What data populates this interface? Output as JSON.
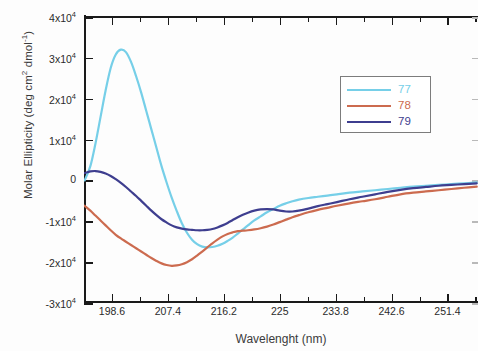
{
  "chart_data": {
    "type": "line",
    "title": "",
    "xlabel": "Wavelenght (nm)",
    "ylabel": "Molar Ellipticity (deg cm2 dmol-1)",
    "ylabel_parts": {
      "prefix": "Molar Ellipticity (deg cm",
      "sup1": "2",
      "middle": " dmol",
      "sup2": "-1",
      "suffix": ")"
    },
    "xlim": [
      194.2,
      256.2
    ],
    "ylim": [
      -30000,
      40000
    ],
    "grid": false,
    "legend_position": "upper-right-inside",
    "xticks": [
      198.6,
      207.4,
      216.2,
      225,
      233.8,
      242.6,
      251.4
    ],
    "xtick_labels": [
      "198.6",
      "207.4",
      "216.2",
      "225",
      "233.8",
      "242.6",
      "251.4"
    ],
    "yticks": [
      40000,
      30000,
      20000,
      10000,
      0,
      -10000,
      -20000,
      -30000
    ],
    "ytick_labels": [
      {
        "mantissa": "4x10",
        "exp": "4"
      },
      {
        "mantissa": "3x10",
        "exp": "4"
      },
      {
        "mantissa": "2x10",
        "exp": "4"
      },
      {
        "mantissa": "1x10",
        "exp": "4"
      },
      {
        "mantissa": "0",
        "exp": ""
      },
      {
        "mantissa": "-1x10",
        "exp": "4"
      },
      {
        "mantissa": "-2x10",
        "exp": "4"
      },
      {
        "mantissa": "-3x10",
        "exp": "4"
      }
    ],
    "series": [
      {
        "name": "77",
        "color": "#76CFE8",
        "x": [
          194.3,
          195.2,
          196.0,
          196.8,
          197.6,
          198.4,
          199.2,
          200.0,
          200.8,
          201.6,
          202.4,
          203.2,
          204.0,
          204.8,
          205.6,
          206.4,
          207.2,
          208.0,
          208.8,
          209.6,
          210.4,
          211.2,
          212.0,
          212.8,
          213.6,
          214.4,
          215.2,
          216.0,
          216.8,
          217.6,
          218.4,
          219.2,
          220.0,
          221.0,
          222.0,
          223.0,
          224.0,
          225.0,
          226.0,
          227.0,
          228.0,
          229.5,
          231.0,
          232.5,
          234.0,
          236.0,
          238.0,
          240.0,
          242.0,
          244.0,
          246.0,
          248.0,
          250.0,
          252.0,
          254.0,
          256.0
        ],
        "y": [
          0,
          3500,
          9000,
          15500,
          22000,
          27500,
          30800,
          32000,
          31400,
          29000,
          25500,
          21500,
          17000,
          12500,
          8000,
          3500,
          -500,
          -4200,
          -7500,
          -10500,
          -12800,
          -14500,
          -15600,
          -16200,
          -16400,
          -16300,
          -16000,
          -15500,
          -14800,
          -14000,
          -13000,
          -12000,
          -11000,
          -9800,
          -8800,
          -7800,
          -7000,
          -6200,
          -5600,
          -5100,
          -4700,
          -4300,
          -4000,
          -3700,
          -3400,
          -3000,
          -2700,
          -2400,
          -2100,
          -1800,
          -1500,
          -1300,
          -1100,
          -900,
          -700,
          -500
        ]
      },
      {
        "name": "78",
        "color": "#CC6B4F",
        "x": [
          194.3,
          195.2,
          196.0,
          196.8,
          197.6,
          198.4,
          199.2,
          200.0,
          200.8,
          201.6,
          202.4,
          203.2,
          204.0,
          204.8,
          205.6,
          206.4,
          207.2,
          208.0,
          208.8,
          209.6,
          210.4,
          211.2,
          212.0,
          212.8,
          213.6,
          214.4,
          215.2,
          216.0,
          216.8,
          217.6,
          218.4,
          219.2,
          220.0,
          221.0,
          222.0,
          223.0,
          224.0,
          225.0,
          226.0,
          227.0,
          228.0,
          229.5,
          231.0,
          232.5,
          234.0,
          236.0,
          238.0,
          240.0,
          242.0,
          244.0,
          246.0,
          248.0,
          250.0,
          252.0,
          254.0,
          256.0
        ],
        "y": [
          -6200,
          -7400,
          -8600,
          -9800,
          -11000,
          -12200,
          -13300,
          -14200,
          -15000,
          -15800,
          -16600,
          -17400,
          -18200,
          -19000,
          -19700,
          -20300,
          -20700,
          -20900,
          -20800,
          -20500,
          -20000,
          -19300,
          -18400,
          -17400,
          -16400,
          -15400,
          -14500,
          -13700,
          -13100,
          -12700,
          -12400,
          -12300,
          -12200,
          -12000,
          -11700,
          -11300,
          -10800,
          -10200,
          -9600,
          -9000,
          -8500,
          -7800,
          -7200,
          -6700,
          -6200,
          -5600,
          -5100,
          -4600,
          -4000,
          -3400,
          -3000,
          -2700,
          -2400,
          -2100,
          -1800,
          -1500
        ]
      },
      {
        "name": "79",
        "color": "#3E3E8F",
        "x": [
          194.3,
          195.2,
          196.0,
          196.8,
          197.6,
          198.4,
          199.2,
          200.0,
          200.8,
          201.6,
          202.4,
          203.2,
          204.0,
          204.8,
          205.6,
          206.4,
          207.2,
          208.0,
          208.8,
          209.6,
          210.4,
          211.2,
          212.0,
          212.8,
          213.6,
          214.4,
          215.2,
          216.0,
          216.8,
          217.6,
          218.4,
          219.2,
          220.0,
          221.0,
          222.0,
          223.0,
          224.0,
          225.0,
          226.0,
          227.0,
          228.0,
          229.5,
          231.0,
          232.5,
          234.0,
          236.0,
          238.0,
          240.0,
          242.0,
          244.0,
          246.0,
          248.0,
          250.0,
          252.0,
          254.0,
          256.0
        ],
        "y": [
          1800,
          2200,
          2300,
          2100,
          1700,
          1100,
          300,
          -600,
          -1600,
          -2700,
          -3800,
          -5000,
          -6200,
          -7400,
          -8500,
          -9500,
          -10300,
          -11000,
          -11500,
          -11800,
          -12000,
          -12100,
          -12200,
          -12200,
          -12100,
          -11900,
          -11500,
          -11000,
          -10400,
          -9700,
          -9000,
          -8400,
          -7900,
          -7400,
          -7100,
          -7000,
          -7100,
          -7400,
          -7600,
          -7600,
          -7400,
          -6900,
          -6300,
          -5800,
          -5300,
          -4600,
          -4000,
          -3400,
          -2800,
          -2300,
          -1900,
          -1600,
          -1300,
          -1100,
          -900,
          -700
        ]
      }
    ]
  }
}
